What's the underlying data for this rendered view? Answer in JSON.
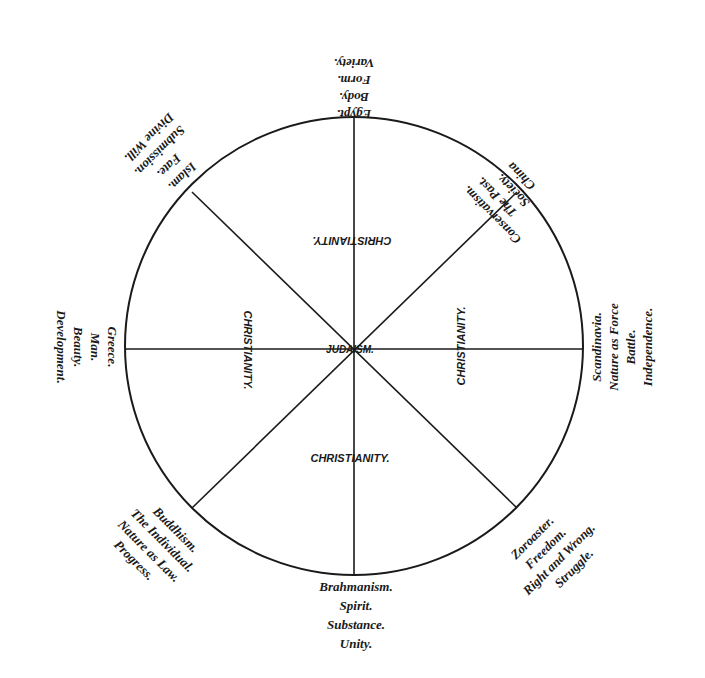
{
  "diagram": {
    "center": {
      "x": 354,
      "y": 346
    },
    "radius": 229,
    "stroke_color": "#1a1a1a",
    "inner_labels": {
      "center": "JUDAISM.",
      "top": "CHRISTIANITY.",
      "bottom": "CHRISTIANITY.",
      "left": "CHRISTIANITY.",
      "right": "CHRISTIANITY."
    },
    "outer_labels": {
      "north": [
        "Egypt.",
        "Body.",
        "Form.",
        "Variety."
      ],
      "northeast": [
        "China",
        "Society.",
        "The Past.",
        "Conservatism."
      ],
      "east": [
        "Scandinavia.",
        "Nature as Force",
        "Battle.",
        "Independence."
      ],
      "southeast": [
        "Zoroaster.",
        "Freedom.",
        "Right and Wrong.",
        "Struggle."
      ],
      "south": [
        "Brahmanism.",
        "Spirit.",
        "Substance.",
        "Unity."
      ],
      "southwest": [
        "Buddhism.",
        "The Individual.",
        "Nature as Law.",
        "Progress."
      ],
      "west": [
        "Greece.",
        "Man.",
        "Beauty.",
        "Development."
      ],
      "northwest": [
        "Islam.",
        "Fate.",
        "Submission.",
        "Divine Will."
      ]
    }
  }
}
